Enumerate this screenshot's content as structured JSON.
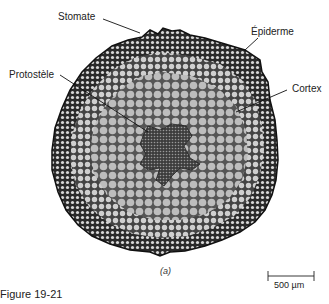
{
  "figure": {
    "number_label": "Figure 19-21",
    "panel_label": "(a)",
    "labels": {
      "stomate": "Stomate",
      "epidermis": "Épiderme",
      "protostele": "Protostèle",
      "cortex": "Cortex"
    },
    "scale_bar": {
      "text": "500 µm"
    },
    "colors": {
      "outer_tissue": "#3a3a3a",
      "inner_tissue": "#b8b8b8",
      "stele": "#555555",
      "background": "#ffffff"
    }
  }
}
